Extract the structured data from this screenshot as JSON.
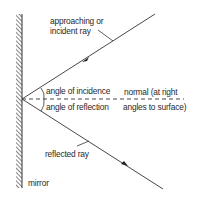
{
  "diagram": {
    "labels": {
      "incident_line1": "approaching or",
      "incident_line2": "incident ray",
      "angle_incidence": "angle of incidence",
      "normal_line1": "normal (at right",
      "normal_line2": "angles to surface)",
      "angle_reflection": "angle of reflection",
      "reflected": "reflected ray",
      "mirror": "mirror"
    },
    "colors": {
      "line": "#333333",
      "background": "#ffffff"
    }
  }
}
